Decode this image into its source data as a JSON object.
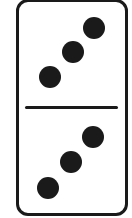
{
  "domino": {
    "top_half_value": 3,
    "bottom_half_value": 3,
    "colors": {
      "ink": "#1a1a1a",
      "face": "#ffffff"
    },
    "top_pips": [
      {
        "cx": 94,
        "cy": 28
      },
      {
        "cx": 73,
        "cy": 52
      },
      {
        "cx": 50,
        "cy": 77
      }
    ],
    "bottom_pips": [
      {
        "cx": 93,
        "cy": 137
      },
      {
        "cx": 71,
        "cy": 162
      },
      {
        "cx": 48,
        "cy": 188
      }
    ]
  }
}
